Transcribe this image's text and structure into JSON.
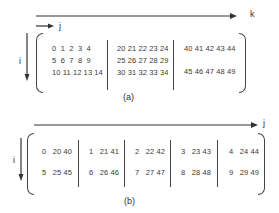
{
  "figure_a": {
    "caption": "(a)",
    "axis_k": "k",
    "axis_j": "j",
    "axis_i": "i",
    "blocks": [
      {
        "rows": [
          "0  1  2  3  4",
          "5  6  7  8  9",
          "10 11 12 13 14"
        ]
      },
      {
        "rows": [
          "20 21 22 23 24",
          "25 26 27 28 29",
          "30 31 32 33 34"
        ]
      },
      {
        "rows": [
          "40 41 42 43 44",
          "",
          "45 46 47 48 49"
        ]
      }
    ]
  },
  "figure_b": {
    "caption": "(b)",
    "axis_j": "j",
    "axis_i": "i",
    "blocks": [
      {
        "rows": [
          "0   20 40",
          "5   25 45"
        ]
      },
      {
        "rows": [
          "1   21 41",
          "6   26 46"
        ]
      },
      {
        "rows": [
          "2   22 42",
          "7   27 47"
        ]
      },
      {
        "rows": [
          "3   23 43",
          "8   28 48"
        ]
      },
      {
        "rows": [
          "4   24 44",
          "9   29 49"
        ]
      }
    ]
  }
}
